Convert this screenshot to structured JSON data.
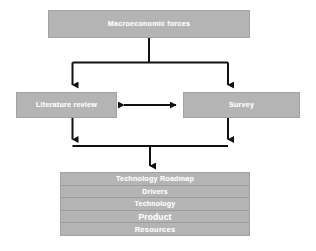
{
  "diagram": {
    "background_color": "#ffffff",
    "box_fill_color": "#b4b4b4",
    "box_border_color": "#a2a2a2",
    "text_color": "#ffffff",
    "connector_color": "#000000"
  },
  "nodes": {
    "top": {
      "label": "Macroeconomic forces"
    },
    "left": {
      "label": "Literature review"
    },
    "right": {
      "label": "Survey"
    }
  },
  "roadmap": {
    "rows": [
      {
        "label": "Technology Roadmap",
        "size": "size-title"
      },
      {
        "label": "Drivers",
        "size": "size-sm"
      },
      {
        "label": "Technology",
        "size": "size-sm"
      },
      {
        "label": "Product",
        "size": "size-lg"
      },
      {
        "label": "Resources",
        "size": "size-md"
      }
    ]
  },
  "connectors": [
    {
      "name": "macroeconomic-to-split",
      "type": "vertical-stem"
    },
    {
      "name": "split-bar-top",
      "type": "horizontal-bar"
    },
    {
      "name": "split-to-literature-review",
      "type": "arrow-down"
    },
    {
      "name": "split-to-survey",
      "type": "arrow-down"
    },
    {
      "name": "literature-review-survey-bidirectional",
      "type": "arrow-double-horizontal"
    },
    {
      "name": "literature-review-to-merge",
      "type": "arrow-down"
    },
    {
      "name": "survey-to-merge",
      "type": "arrow-down"
    },
    {
      "name": "merge-bar-bottom",
      "type": "horizontal-bar"
    },
    {
      "name": "merge-to-roadmap",
      "type": "arrow-down"
    }
  ]
}
